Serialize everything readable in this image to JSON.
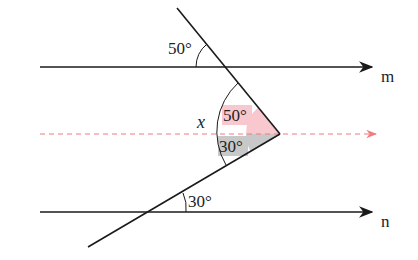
{
  "diagram": {
    "type": "parallel-lines-angle",
    "lines": {
      "m": {
        "label": "m"
      },
      "n": {
        "label": "n"
      },
      "auxiliary": {
        "style": "dashed",
        "color": "#f08080"
      }
    },
    "angles": {
      "top_given": "50°",
      "bottom_given": "30°",
      "upper_part": "50°",
      "lower_part": "30°",
      "unknown": "x"
    },
    "colors": {
      "line": "#1a1a1a",
      "dashed": "#f07c7c",
      "upper_fill": "#f9c8cf",
      "lower_fill": "#c8c8c8"
    }
  }
}
